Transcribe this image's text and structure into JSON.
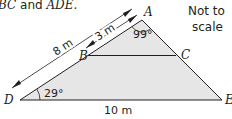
{
  "caption": {
    "text_part1": "BC",
    "text_part2": " and ",
    "text_part3": "ADE."
  },
  "note": {
    "line1": "Not to",
    "line2": "scale"
  },
  "points": {
    "A": "A",
    "B": "B",
    "C": "C",
    "D": "D",
    "E": "E"
  },
  "measurements": {
    "AD": "8 m",
    "AB": "3 m",
    "DE": "10 m"
  },
  "angles": {
    "D": "29°",
    "A": "99°"
  },
  "colors": {
    "fill": "#e6e6e6",
    "stroke": "#231f20"
  }
}
